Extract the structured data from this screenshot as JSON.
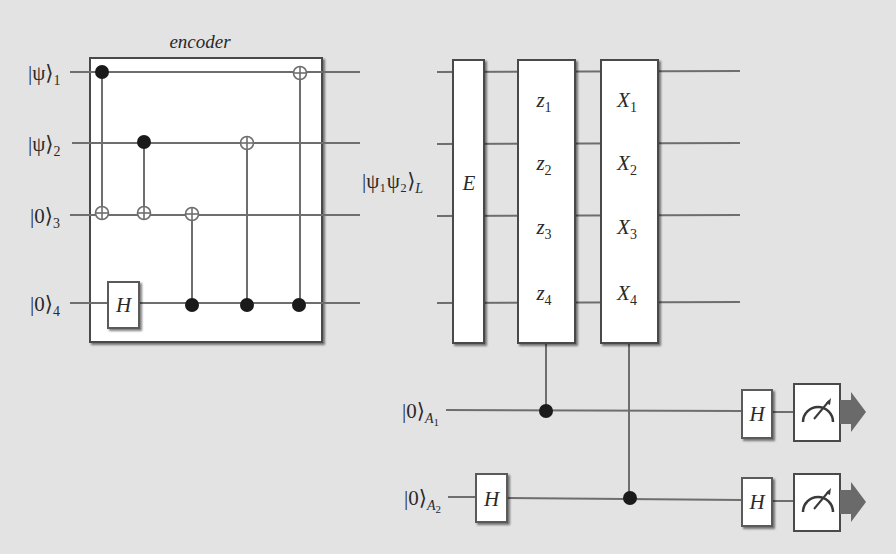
{
  "diagram": {
    "type": "quantum-circuit",
    "background": "#e3e3e3",
    "wire_color": "#6e6e6e",
    "box_stroke": "#4a4a4a",
    "box_fill": "#ffffff",
    "arrow_color": "#6a6a6a",
    "encoder": {
      "title": "encoder",
      "inputs": [
        {
          "ket": "|ψ⟩",
          "sub": "1"
        },
        {
          "ket": "|ψ⟩",
          "sub": "2"
        },
        {
          "ket": "|0⟩",
          "sub": "3"
        },
        {
          "ket": "|0⟩",
          "sub": "4"
        }
      ],
      "gates": [
        {
          "type": "cnot",
          "control": 1,
          "target": 3
        },
        {
          "type": "cnot",
          "control": 2,
          "target": 3
        },
        {
          "type": "H",
          "qubit": 4,
          "label": "H"
        },
        {
          "type": "cnot",
          "control": 4,
          "target": 3
        },
        {
          "type": "cnot",
          "control": 4,
          "target": 2
        },
        {
          "type": "cnot",
          "control": 4,
          "target": 1
        }
      ]
    },
    "syndrome": {
      "logical_state_label": "|ψ₁ψ₂⟩",
      "logical_state_sub": "L",
      "error_box": "E",
      "z_box": [
        {
          "op": "z",
          "sub": "1"
        },
        {
          "op": "z",
          "sub": "2"
        },
        {
          "op": "z",
          "sub": "3"
        },
        {
          "op": "z",
          "sub": "4"
        }
      ],
      "x_box": [
        {
          "op": "X",
          "sub": "1"
        },
        {
          "op": "X",
          "sub": "2"
        },
        {
          "op": "X",
          "sub": "3"
        },
        {
          "op": "X",
          "sub": "4"
        }
      ],
      "ancillas": [
        {
          "ket": "|0⟩",
          "sub": "A",
          "subsub": "1",
          "pre_gate": "",
          "controlled_by": "z-box",
          "post_gate": "H",
          "measure": true
        },
        {
          "ket": "|0⟩",
          "sub": "A",
          "subsub": "2",
          "pre_gate": "H",
          "controlled_by": "x-box",
          "post_gate": "H",
          "measure": true
        }
      ]
    }
  }
}
